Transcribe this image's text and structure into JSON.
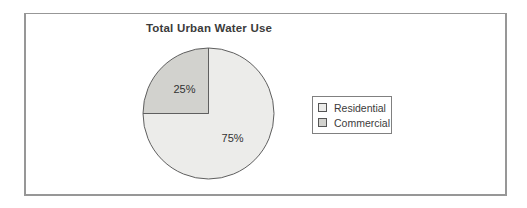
{
  "chart_data": {
    "type": "pie",
    "title": "Total Urban Water Use",
    "slices": [
      {
        "label": "Residential",
        "value": 75,
        "display": "75%",
        "color": "#ececea"
      },
      {
        "label": "Commercial",
        "value": 25,
        "display": "25%",
        "color": "#d2d2ce"
      }
    ],
    "start_angle_deg": -90,
    "direction": "clockwise",
    "outline_color": "#5f5f5f",
    "label_color": "#333333",
    "legend_position": "right",
    "legend_items": [
      "Residential",
      "Commercial"
    ]
  },
  "frame": {
    "border_color": "#979797",
    "background": "#ffffff"
  }
}
